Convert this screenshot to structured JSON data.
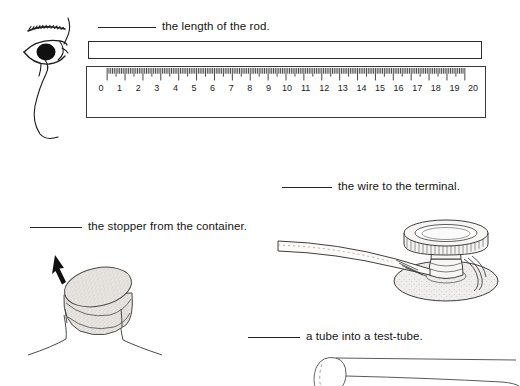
{
  "page": {
    "background_color": "#ffffff",
    "ink_color": "#1a1a1a",
    "kind": "worksheet-fill-in-the-blank"
  },
  "items": [
    {
      "id": "rod-length",
      "blank_label": "blank-line",
      "text": "the length of the rod.",
      "illustration": "eye-ruler-rod"
    },
    {
      "id": "stopper-container",
      "blank_label": "blank-line",
      "text": "the stopper from the container.",
      "illustration": "stopper-being-pulled-from-flask-neck"
    },
    {
      "id": "wire-terminal",
      "blank_label": "blank-line",
      "text": "the wire to the terminal.",
      "illustration": "wire-and-binding-post-terminal"
    },
    {
      "id": "tube-test-tube",
      "blank_label": "blank-line",
      "text": "a tube into a test-tube.",
      "illustration": "tube-entering-test-tube"
    }
  ],
  "ruler": {
    "name": "centimetre-ruler",
    "unit_start": 0,
    "unit_end": 20,
    "labels": [
      "0",
      "1",
      "2",
      "3",
      "4",
      "5",
      "6",
      "7",
      "8",
      "9",
      "10",
      "11",
      "12",
      "13",
      "14",
      "15",
      "16",
      "17",
      "18",
      "19",
      "20"
    ],
    "minor_divisions_per_unit": 10
  },
  "rod": {
    "name": "measured-rod",
    "shape": "long thin rectangle"
  },
  "arrow": {
    "name": "pull-direction-arrow",
    "direction": "up-left"
  }
}
